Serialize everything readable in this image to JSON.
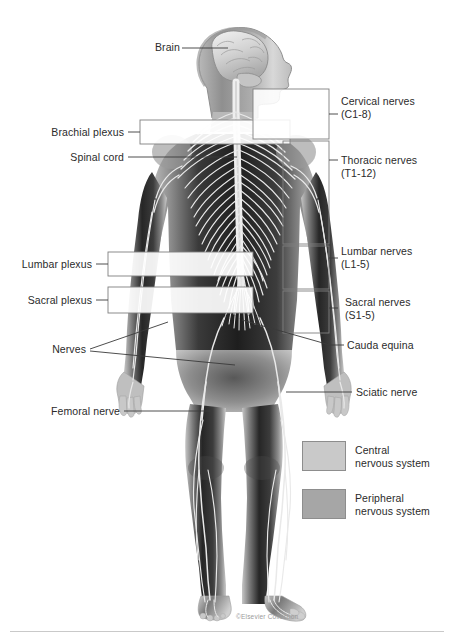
{
  "diagram": {
    "credit": "©Elsevier Collection"
  },
  "labels_left": [
    {
      "id": "brain",
      "text": "Brain"
    },
    {
      "id": "brachial",
      "text": "Brachial plexus"
    },
    {
      "id": "spinal-cord",
      "text": "Spinal cord"
    },
    {
      "id": "lumbar-plexus",
      "text": "Lumbar plexus"
    },
    {
      "id": "sacral-plexus",
      "text": "Sacral plexus"
    },
    {
      "id": "nerves",
      "text": "Nerves"
    },
    {
      "id": "femoral",
      "text": "Femoral nerve"
    }
  ],
  "labels_right": [
    {
      "id": "cervical",
      "text": "Cervical nerves\n(C1-8)"
    },
    {
      "id": "thoracic",
      "text": "Thoracic nerves\n(T1-12)"
    },
    {
      "id": "lumbar",
      "text": "Lumbar nerves\n(L1-5)"
    },
    {
      "id": "sacral",
      "text": "Sacral nerves\n(S1-5)"
    },
    {
      "id": "cauda",
      "text": "Cauda equina"
    },
    {
      "id": "sciatic",
      "text": "Sciatic nerve"
    }
  ],
  "legend": {
    "items": [
      {
        "id": "central",
        "text": "Central\nnervous system",
        "color": "#c9c9c9"
      },
      {
        "id": "peripheral",
        "text": "Peripheral\nnervous system",
        "color": "#a6a6a6"
      }
    ]
  },
  "colors": {
    "leader_line": "#3a3a3a",
    "box_stroke": "#7f7f7f",
    "text": "#2b2b2b",
    "body_light": "#d9d9d9",
    "body_mid": "#9b9b9b",
    "body_dark": "#2a2a2a",
    "nerve": "#e8e8e8"
  }
}
